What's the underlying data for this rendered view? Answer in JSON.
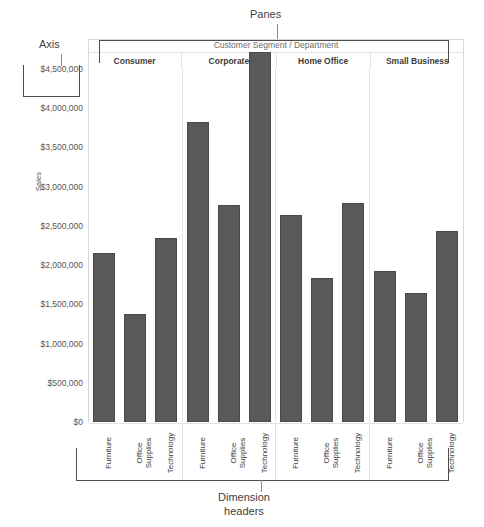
{
  "annotations": {
    "panes": "Panes",
    "axis": "Axis",
    "dimension_headers": "Dimension\nheaders"
  },
  "chart_data": {
    "type": "bar",
    "title": "",
    "pane_title": "Customer Segment  /  Department",
    "xlabel": "",
    "ylabel": "Sales",
    "ylim": [
      0,
      4500000
    ],
    "grid": false,
    "legend": "none",
    "bar_color": "#595959",
    "tick_labels": [
      "$4,500,000",
      "$4,000,000",
      "$3,500,000",
      "$3,000,000",
      "$2,500,000",
      "$2,000,000",
      "$1,500,000",
      "$1,000,000",
      "$500,000",
      "$0"
    ],
    "tick_values": [
      4500000,
      4000000,
      3500000,
      3000000,
      2500000,
      2000000,
      1500000,
      1000000,
      500000,
      0
    ],
    "segments": [
      "Consumer",
      "Corporate",
      "Home Office",
      "Small Business"
    ],
    "categories": [
      "Furniture",
      "Office Supplies",
      "Technology"
    ],
    "panes": [
      {
        "segment": "Consumer",
        "bars": [
          {
            "category": "Furniture",
            "label": "Furniture",
            "value": 2160000
          },
          {
            "category": "Office Supplies",
            "label": "Office\nSupplies",
            "value": 1380000
          },
          {
            "category": "Technology",
            "label": "Technology",
            "value": 2350000
          }
        ]
      },
      {
        "segment": "Corporate",
        "bars": [
          {
            "category": "Furniture",
            "label": "Furniture",
            "value": 3820000
          },
          {
            "category": "Office Supplies",
            "label": "Office\nSupplies",
            "value": 2770000
          },
          {
            "category": "Technology",
            "label": "Technology",
            "value": 4720000
          }
        ]
      },
      {
        "segment": "Home Office",
        "bars": [
          {
            "category": "Furniture",
            "label": "Furniture",
            "value": 2640000
          },
          {
            "category": "Office Supplies",
            "label": "Office\nSupplies",
            "value": 1830000
          },
          {
            "category": "Technology",
            "label": "Technology",
            "value": 2790000
          }
        ]
      },
      {
        "segment": "Small Business",
        "bars": [
          {
            "category": "Furniture",
            "label": "Furniture",
            "value": 1920000
          },
          {
            "category": "Office Supplies",
            "label": "Office\nSupplies",
            "value": 1640000
          },
          {
            "category": "Technology",
            "label": "Technology",
            "value": 2440000
          }
        ]
      }
    ]
  }
}
